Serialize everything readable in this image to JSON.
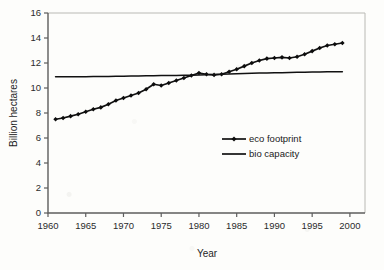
{
  "chart_data": {
    "type": "line",
    "title": "",
    "xlabel": "Year",
    "ylabel": "Billion hectares",
    "xlim": [
      1960,
      2002
    ],
    "ylim": [
      0,
      16
    ],
    "grid": false,
    "legend_position": "inside-right",
    "x_ticks": [
      "1960",
      "1965",
      "1970",
      "1975",
      "1980",
      "1985",
      "1990",
      "1995",
      "2000"
    ],
    "x_tick_values": [
      1960,
      1965,
      1970,
      1975,
      1980,
      1985,
      1990,
      1995,
      2000
    ],
    "y_ticks": [
      "0",
      "2",
      "4",
      "6",
      "8",
      "10",
      "12",
      "14",
      "16"
    ],
    "y_tick_values": [
      0,
      2,
      4,
      6,
      8,
      10,
      12,
      14,
      16
    ],
    "x": [
      1961,
      1962,
      1963,
      1964,
      1965,
      1966,
      1967,
      1968,
      1969,
      1970,
      1971,
      1972,
      1973,
      1974,
      1975,
      1976,
      1977,
      1978,
      1979,
      1980,
      1981,
      1982,
      1983,
      1984,
      1985,
      1986,
      1987,
      1988,
      1989,
      1990,
      1991,
      1992,
      1993,
      1994,
      1995,
      1996,
      1997,
      1998,
      1999
    ],
    "series": [
      {
        "name": "eco footprint",
        "marker": "diamond",
        "values": [
          7.5,
          7.6,
          7.75,
          7.9,
          8.1,
          8.3,
          8.45,
          8.7,
          9.0,
          9.2,
          9.4,
          9.6,
          9.9,
          10.3,
          10.2,
          10.4,
          10.6,
          10.8,
          11.0,
          11.2,
          11.1,
          11.05,
          11.1,
          11.3,
          11.5,
          11.75,
          12.0,
          12.2,
          12.35,
          12.4,
          12.45,
          12.4,
          12.5,
          12.7,
          12.95,
          13.2,
          13.4,
          13.5,
          13.6
        ]
      },
      {
        "name": "bio capacity",
        "marker": "none",
        "values": [
          10.9,
          10.9,
          10.9,
          10.9,
          10.91,
          10.92,
          10.92,
          10.93,
          10.94,
          10.95,
          10.96,
          10.97,
          10.98,
          10.99,
          11.0,
          11.0,
          11.01,
          11.02,
          11.03,
          11.05,
          11.06,
          11.08,
          11.1,
          11.12,
          11.14,
          11.16,
          11.18,
          11.2,
          11.2,
          11.22,
          11.22,
          11.25,
          11.26,
          11.27,
          11.28,
          11.29,
          11.3,
          11.3,
          11.3
        ]
      }
    ]
  },
  "legend": {
    "entries": [
      {
        "label": "eco footprint"
      },
      {
        "label": "bio capacity"
      }
    ]
  },
  "colors": {
    "series": "#111111",
    "axis": "#5d5d5d",
    "background": "#fdfdfb"
  }
}
